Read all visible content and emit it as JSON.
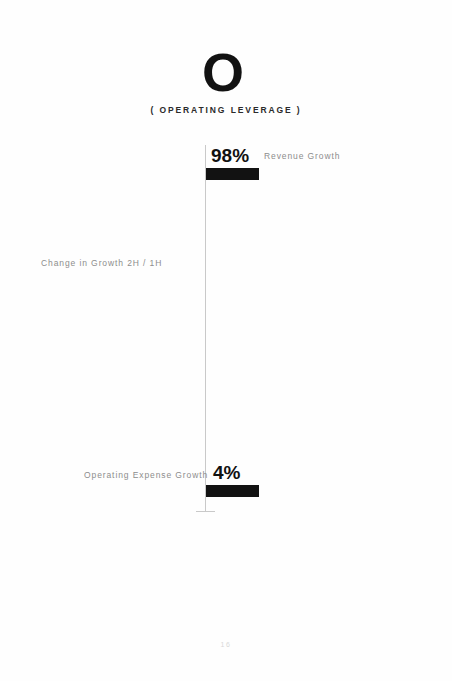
{
  "slide": {
    "letter_mark": "O",
    "subtitle": "( OPERATING LEVERAGE )",
    "page_number": "16"
  },
  "chart_data": {
    "type": "bar",
    "title": "O ( OPERATING LEVERAGE )",
    "xlabel": "",
    "ylabel": "Change in Growth 2H / 1H",
    "axis_title": "Change in Growth 2H / 1H",
    "orientation": "horizontal",
    "grid": false,
    "legend": "none",
    "unit": "%",
    "categories": [
      "Revenue Growth",
      "Operating Expense Growth"
    ],
    "values": [
      98,
      4
    ],
    "value_labels": [
      "98%",
      "4%"
    ],
    "bar_color": "#121212",
    "axis_color": "#c9c9c9",
    "label_color": "#8d8d8d",
    "series": [
      {
        "name": "Change in Growth 2H / 1H",
        "points": [
          {
            "category": "Revenue Growth",
            "value": 98,
            "label": "98%"
          },
          {
            "category": "Operating Expense Growth",
            "value": 4,
            "label": "4%"
          }
        ]
      }
    ]
  }
}
